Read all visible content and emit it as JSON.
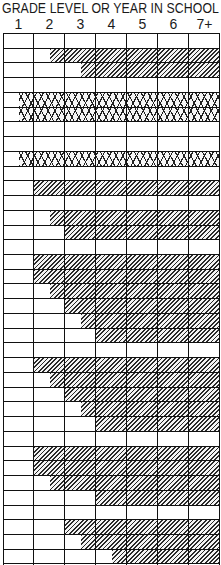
{
  "header": {
    "title": "GRADE LEVEL OR YEAR IN SCHOOL",
    "columns": [
      "1",
      "2",
      "3",
      "4",
      "5",
      "6",
      "7+"
    ]
  },
  "chart_data": {
    "type": "table",
    "title": "GRADE LEVEL OR YEAR IN SCHOOL",
    "xlabel": "Grade level or year in school",
    "categories": [
      "1",
      "2",
      "3",
      "4",
      "5",
      "6",
      "7+"
    ],
    "row_count": 36,
    "note": "start = offset in columns from the left edge of grade 1 where shading begins (0.5 = middle of grade 1 column); shading extends to 7+",
    "patterns": {
      "hatch": "diagonal hatch",
      "cross": "crosshatch (diamond)"
    },
    "rows": [
      {
        "pattern": "none"
      },
      {
        "pattern": "hatch",
        "start": 1.5
      },
      {
        "pattern": "hatch",
        "start": 2.5
      },
      {
        "pattern": "none"
      },
      {
        "pattern": "cross",
        "start": 0.5
      },
      {
        "pattern": "cross",
        "start": 0.5
      },
      {
        "pattern": "none"
      },
      {
        "pattern": "none"
      },
      {
        "pattern": "cross",
        "start": 0.5
      },
      {
        "pattern": "none"
      },
      {
        "pattern": "hatch",
        "start": 1
      },
      {
        "pattern": "none"
      },
      {
        "pattern": "hatch",
        "start": 1.5
      },
      {
        "pattern": "hatch",
        "start": 2
      },
      {
        "pattern": "none"
      },
      {
        "pattern": "hatch",
        "start": 1
      },
      {
        "pattern": "hatch",
        "start": 1
      },
      {
        "pattern": "hatch",
        "start": 1.5
      },
      {
        "pattern": "hatch",
        "start": 2
      },
      {
        "pattern": "hatch",
        "start": 2.5
      },
      {
        "pattern": "hatch",
        "start": 3
      },
      {
        "pattern": "none"
      },
      {
        "pattern": "hatch",
        "start": 1
      },
      {
        "pattern": "hatch",
        "start": 1.5
      },
      {
        "pattern": "hatch",
        "start": 2
      },
      {
        "pattern": "hatch",
        "start": 2.5
      },
      {
        "pattern": "hatch",
        "start": 3
      },
      {
        "pattern": "none"
      },
      {
        "pattern": "hatch",
        "start": 1
      },
      {
        "pattern": "hatch",
        "start": 1
      },
      {
        "pattern": "hatch",
        "start": 1.5
      },
      {
        "pattern": "hatch",
        "start": 3
      },
      {
        "pattern": "none"
      },
      {
        "pattern": "hatch",
        "start": 2
      },
      {
        "pattern": "hatch",
        "start": 2.5
      },
      {
        "pattern": "hatch",
        "start": 3.5
      }
    ]
  }
}
